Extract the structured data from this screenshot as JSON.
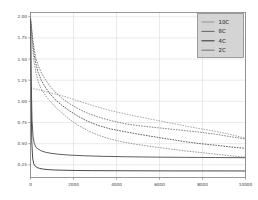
{
  "chart_data": {
    "type": "line",
    "title": "",
    "xlabel": "",
    "ylabel": "",
    "xlim": [
      0,
      10000
    ],
    "ylim": [
      0.1,
      2.05
    ],
    "grid": true,
    "legend_position": "top-right",
    "xticks": [
      0,
      2000,
      4000,
      6000,
      8000,
      10000
    ],
    "xtick_labels": [
      "0",
      "2000",
      "4000",
      "6000",
      "8000",
      "10000"
    ],
    "yticks": [
      0.25,
      0.5,
      0.75,
      1.0,
      1.25,
      1.5,
      1.75,
      2.0
    ],
    "ytick_labels": [
      "0.25",
      "0.50",
      "0.75",
      "1.00",
      "1.25",
      "1.50",
      "1.75",
      "2.00"
    ],
    "series": [
      {
        "name": "10C",
        "color": "#9a9a9a",
        "style": "dashed",
        "width": 0.85,
        "x": [
          0,
          60,
          130,
          220,
          340,
          480,
          650,
          850,
          1100,
          1400,
          1750,
          2150,
          2600,
          3100,
          3650,
          4250,
          4900,
          5600,
          6300,
          7000,
          7700,
          8400,
          9100,
          9600,
          10000
        ],
        "y": [
          1.16,
          1.155,
          1.15,
          1.145,
          1.14,
          1.13,
          1.12,
          1.105,
          1.09,
          1.07,
          1.045,
          1.01,
          0.975,
          0.935,
          0.895,
          0.86,
          0.825,
          0.79,
          0.755,
          0.72,
          0.685,
          0.655,
          0.62,
          0.59,
          0.565
        ]
      },
      {
        "name": "8C",
        "color": "#707070",
        "style": "dashed",
        "width": 0.85,
        "x": [
          0,
          40,
          90,
          160,
          250,
          360,
          500,
          680,
          900,
          1150,
          1450,
          1800,
          2200,
          2650,
          3150,
          3700,
          4300,
          4950,
          5650,
          6400,
          7150,
          7900,
          8650,
          9350,
          10000
        ],
        "y": [
          1.97,
          1.9,
          1.77,
          1.63,
          1.51,
          1.42,
          1.34,
          1.26,
          1.18,
          1.11,
          1.04,
          0.975,
          0.915,
          0.86,
          0.815,
          0.775,
          0.74,
          0.715,
          0.695,
          0.675,
          0.655,
          0.635,
          0.61,
          0.58,
          0.555
        ]
      },
      {
        "name": "4C",
        "color": "#4a4a4a",
        "style": "dashed",
        "width": 0.9,
        "x": [
          0,
          40,
          90,
          160,
          250,
          360,
          500,
          680,
          900,
          1150,
          1450,
          1800,
          2200,
          2650,
          3150,
          3700,
          4300,
          4950,
          5650,
          6400,
          7150,
          7900,
          8650,
          9350,
          10000
        ],
        "y": [
          1.98,
          1.88,
          1.72,
          1.57,
          1.44,
          1.34,
          1.25,
          1.17,
          1.09,
          1.02,
          0.955,
          0.89,
          0.825,
          0.765,
          0.715,
          0.675,
          0.645,
          0.615,
          0.585,
          0.555,
          0.525,
          0.5,
          0.48,
          0.46,
          0.445
        ]
      },
      {
        "name": "2C",
        "color": "#888888",
        "style": "dashed",
        "width": 0.85,
        "x": [
          0,
          40,
          90,
          160,
          250,
          360,
          500,
          680,
          900,
          1150,
          1450,
          1800,
          2200,
          2650,
          3150,
          3700,
          4300,
          4950,
          5650,
          6400,
          7150,
          7900,
          8650,
          9350,
          10000
        ],
        "y": [
          1.99,
          1.85,
          1.66,
          1.48,
          1.34,
          1.23,
          1.145,
          1.075,
          1.005,
          0.935,
          0.865,
          0.79,
          0.72,
          0.655,
          0.6,
          0.555,
          0.52,
          0.49,
          0.465,
          0.44,
          0.415,
          0.395,
          0.375,
          0.355,
          0.34
        ]
      },
      {
        "name": "plateau-upper",
        "color": "#555555",
        "style": "solid",
        "width": 0.95,
        "x": [
          0,
          30,
          70,
          120,
          180,
          260,
          360,
          500,
          700,
          950,
          1300,
          1800,
          2500,
          3400,
          4500,
          5800,
          7200,
          8600,
          10000
        ],
        "y": [
          1.98,
          1.3,
          0.78,
          0.58,
          0.5,
          0.455,
          0.435,
          0.415,
          0.398,
          0.386,
          0.375,
          0.365,
          0.357,
          0.35,
          0.345,
          0.341,
          0.338,
          0.336,
          0.334
        ]
      },
      {
        "name": "plateau-lower",
        "color": "#3f3f3f",
        "style": "solid",
        "width": 0.95,
        "x": [
          0,
          25,
          60,
          100,
          150,
          220,
          310,
          430,
          600,
          820,
          1100,
          1500,
          2100,
          2900,
          3900,
          5100,
          6500,
          8200,
          10000
        ],
        "y": [
          1.97,
          1.05,
          0.52,
          0.33,
          0.262,
          0.233,
          0.218,
          0.207,
          0.199,
          0.193,
          0.189,
          0.186,
          0.183,
          0.181,
          0.18,
          0.179,
          0.178,
          0.178,
          0.177
        ]
      }
    ]
  },
  "legend": {
    "entries": [
      {
        "label": "10C"
      },
      {
        "label": "8C"
      },
      {
        "label": "4C"
      },
      {
        "label": "2C"
      }
    ]
  }
}
